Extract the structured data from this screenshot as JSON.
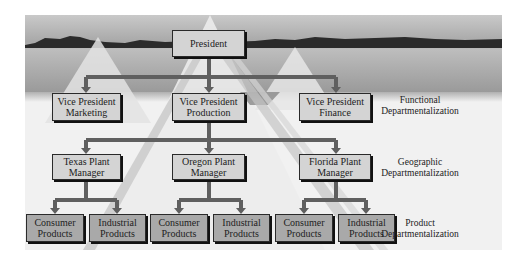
{
  "diagram": {
    "type": "organization-chart",
    "top": {
      "label": "President"
    },
    "levels": [
      {
        "name": "Functional Departmentalization",
        "nodes": [
          "Vice President Marketing",
          "Vice President Production",
          "Vice President Finance"
        ]
      },
      {
        "name": "Geographic Departmentalization",
        "parent": "Vice President Production",
        "nodes": [
          "Texas Plant Manager",
          "Oregon Plant Manager",
          "Florida Plant Manager"
        ]
      },
      {
        "name": "Product Departmentalization",
        "nodes": [
          {
            "parent": "Texas Plant Manager",
            "label": "Consumer Products"
          },
          {
            "parent": "Texas Plant Manager",
            "label": "Industrial Products"
          },
          {
            "parent": "Oregon Plant Manager",
            "label": "Consumer Products"
          },
          {
            "parent": "Oregon Plant Manager",
            "label": "Industrial Products"
          },
          {
            "parent": "Florida Plant Manager",
            "label": "Consumer Products"
          },
          {
            "parent": "Florida Plant Manager",
            "label": "Industrial Products"
          }
        ]
      }
    ]
  },
  "boxes": {
    "president": "President",
    "vp_marketing_1": "Vice President",
    "vp_marketing_2": "Marketing",
    "vp_production_1": "Vice President",
    "vp_production_2": "Production",
    "vp_finance_1": "Vice President",
    "vp_finance_2": "Finance",
    "texas_1": "Texas Plant",
    "texas_2": "Manager",
    "oregon_1": "Oregon Plant",
    "oregon_2": "Manager",
    "florida_1": "Florida Plant",
    "florida_2": "Manager",
    "products": [
      {
        "l1": "Consumer",
        "l2": "Products"
      },
      {
        "l1": "Industrial",
        "l2": "Products"
      },
      {
        "l1": "Consumer",
        "l2": "Products"
      },
      {
        "l1": "Industrial",
        "l2": "Products"
      },
      {
        "l1": "Consumer",
        "l2": "Products"
      },
      {
        "l1": "Industrial",
        "l2": "Products"
      }
    ]
  },
  "side_labels": {
    "functional_1": "Functional",
    "functional_2": "Departmentalization",
    "geographic_1": "Geographic",
    "geographic_2": "Departmentalization",
    "product_1": "Product",
    "product_2": "Departmentalization"
  },
  "colors": {
    "box_light": "#d4d4d4",
    "box_dark": "#a9a9a9",
    "connector": "#666666",
    "mountain": "#2b2b2b"
  }
}
